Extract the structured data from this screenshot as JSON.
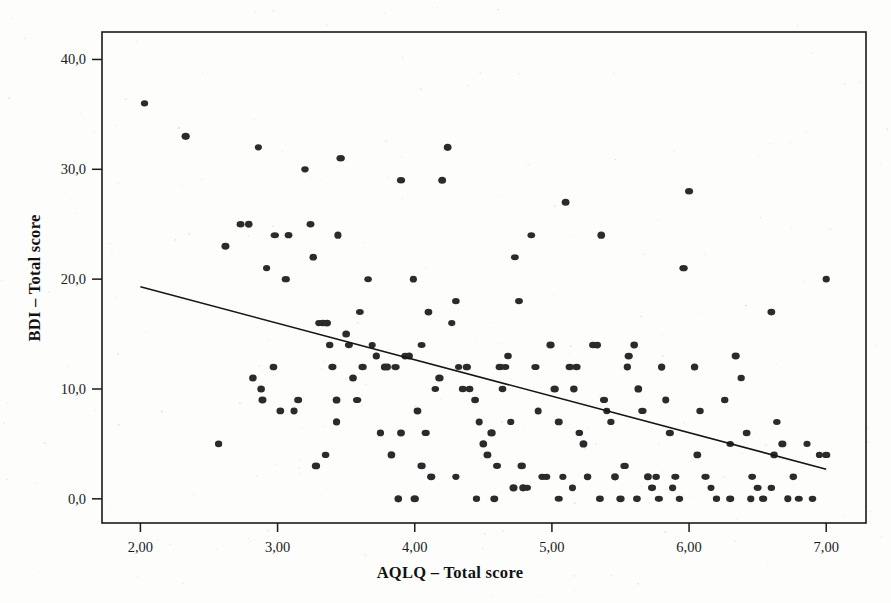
{
  "chart_data": {
    "type": "scatter",
    "title": "",
    "xlabel": "AQLQ – Total score",
    "ylabel": "BDI – Total score",
    "xlim": [
      1.72,
      7.29
    ],
    "ylim": [
      -2.2,
      42.5
    ],
    "xticks": [
      2,
      3,
      4,
      5,
      6,
      7
    ],
    "xtick_labels": [
      "2,00",
      "3,00",
      "4,00",
      "5,00",
      "6,00",
      "7,00"
    ],
    "yticks": [
      0,
      10,
      20,
      30,
      40
    ],
    "ytick_labels": [
      "0,0",
      "10,0",
      "20,0",
      "30,0",
      "40,0"
    ],
    "grid": false,
    "legend": "none",
    "marker": "filled-circle",
    "marker_color": "#2b2b2b",
    "frame_color": "#1a1a1a",
    "fit_line": {
      "label": "linear regression",
      "x": [
        2.0,
        7.0
      ],
      "y": [
        19.3,
        2.7
      ],
      "slope": -3.32,
      "intercept": 25.94,
      "color": "#151515"
    },
    "points": [
      [
        2.03,
        36.0
      ],
      [
        2.33,
        33.0
      ],
      [
        2.62,
        23.0
      ],
      [
        2.57,
        5.0
      ],
      [
        2.73,
        25.0
      ],
      [
        2.79,
        25.0
      ],
      [
        2.82,
        11.0
      ],
      [
        2.86,
        32.0
      ],
      [
        2.88,
        10.0
      ],
      [
        2.89,
        9.0
      ],
      [
        2.92,
        21.0
      ],
      [
        2.97,
        12.0
      ],
      [
        3.02,
        8.0
      ],
      [
        3.06,
        20.0
      ],
      [
        3.12,
        8.0
      ],
      [
        3.15,
        9.0
      ],
      [
        3.2,
        30.0
      ],
      [
        3.24,
        25.0
      ],
      [
        3.26,
        22.0
      ],
      [
        3.28,
        3.0
      ],
      [
        3.3,
        16.0
      ],
      [
        3.33,
        16.0
      ],
      [
        3.36,
        16.0
      ],
      [
        3.38,
        14.0
      ],
      [
        3.4,
        12.0
      ],
      [
        3.43,
        9.0
      ],
      [
        3.46,
        31.0
      ],
      [
        3.5,
        15.0
      ],
      [
        3.52,
        14.0
      ],
      [
        3.55,
        11.0
      ],
      [
        3.58,
        9.0
      ],
      [
        3.62,
        12.0
      ],
      [
        3.66,
        20.0
      ],
      [
        3.69,
        14.0
      ],
      [
        3.72,
        13.0
      ],
      [
        3.75,
        6.0
      ],
      [
        3.78,
        12.0
      ],
      [
        3.8,
        12.0
      ],
      [
        3.83,
        4.0
      ],
      [
        3.86,
        12.0
      ],
      [
        3.9,
        29.0
      ],
      [
        3.93,
        13.0
      ],
      [
        3.96,
        13.0
      ],
      [
        3.99,
        20.0
      ],
      [
        4.02,
        8.0
      ],
      [
        4.05,
        14.0
      ],
      [
        4.08,
        6.0
      ],
      [
        4.12,
        2.0
      ],
      [
        4.15,
        10.0
      ],
      [
        4.18,
        11.0
      ],
      [
        4.2,
        29.0
      ],
      [
        4.24,
        32.0
      ],
      [
        4.27,
        16.0
      ],
      [
        4.3,
        18.0
      ],
      [
        4.32,
        12.0
      ],
      [
        4.35,
        10.0
      ],
      [
        4.38,
        12.0
      ],
      [
        4.4,
        10.0
      ],
      [
        4.44,
        9.0
      ],
      [
        4.47,
        7.0
      ],
      [
        4.5,
        5.0
      ],
      [
        4.53,
        4.0
      ],
      [
        4.56,
        6.0
      ],
      [
        4.6,
        3.0
      ],
      [
        4.64,
        10.0
      ],
      [
        4.68,
        13.0
      ],
      [
        4.7,
        7.0
      ],
      [
        4.73,
        22.0
      ],
      [
        4.76,
        18.0
      ],
      [
        4.79,
        1.0
      ],
      [
        4.82,
        1.0
      ],
      [
        4.85,
        24.0
      ],
      [
        4.88,
        12.0
      ],
      [
        4.9,
        8.0
      ],
      [
        4.93,
        2.0
      ],
      [
        4.96,
        2.0
      ],
      [
        4.99,
        14.0
      ],
      [
        5.02,
        10.0
      ],
      [
        5.05,
        7.0
      ],
      [
        5.08,
        2.0
      ],
      [
        5.1,
        27.0
      ],
      [
        5.13,
        12.0
      ],
      [
        5.16,
        10.0
      ],
      [
        5.2,
        6.0
      ],
      [
        5.23,
        5.0
      ],
      [
        5.26,
        2.0
      ],
      [
        5.3,
        14.0
      ],
      [
        5.33,
        14.0
      ],
      [
        5.36,
        24.0
      ],
      [
        5.38,
        9.0
      ],
      [
        5.4,
        8.0
      ],
      [
        5.43,
        7.0
      ],
      [
        5.46,
        2.0
      ],
      [
        5.5,
        0.0
      ],
      [
        5.53,
        3.0
      ],
      [
        5.56,
        13.0
      ],
      [
        5.6,
        14.0
      ],
      [
        5.63,
        10.0
      ],
      [
        5.66,
        8.0
      ],
      [
        5.7,
        2.0
      ],
      [
        5.73,
        1.0
      ],
      [
        5.76,
        2.0
      ],
      [
        5.8,
        12.0
      ],
      [
        5.83,
        9.0
      ],
      [
        5.86,
        6.0
      ],
      [
        5.9,
        2.0
      ],
      [
        5.93,
        0.0
      ],
      [
        5.96,
        21.0
      ],
      [
        6.0,
        28.0
      ],
      [
        6.04,
        12.0
      ],
      [
        6.08,
        8.0
      ],
      [
        6.12,
        2.0
      ],
      [
        6.16,
        1.0
      ],
      [
        6.2,
        0.0
      ],
      [
        6.26,
        9.0
      ],
      [
        6.3,
        5.0
      ],
      [
        6.34,
        13.0
      ],
      [
        6.38,
        11.0
      ],
      [
        6.42,
        6.0
      ],
      [
        6.46,
        2.0
      ],
      [
        6.5,
        1.0
      ],
      [
        6.54,
        0.0
      ],
      [
        6.6,
        17.0
      ],
      [
        6.64,
        7.0
      ],
      [
        6.68,
        5.0
      ],
      [
        6.72,
        0.0
      ],
      [
        6.76,
        2.0
      ],
      [
        6.8,
        0.0
      ],
      [
        6.86,
        5.0
      ],
      [
        6.9,
        0.0
      ],
      [
        6.95,
        4.0
      ],
      [
        7.0,
        20.0
      ],
      [
        7.0,
        4.0
      ],
      [
        2.98,
        24.0
      ],
      [
        3.08,
        24.0
      ],
      [
        3.44,
        24.0
      ],
      [
        3.6,
        17.0
      ],
      [
        4.1,
        17.0
      ],
      [
        4.62,
        12.0
      ],
      [
        4.66,
        12.0
      ],
      [
        5.18,
        12.0
      ],
      [
        5.55,
        12.0
      ],
      [
        6.06,
        4.0
      ],
      [
        6.62,
        4.0
      ],
      [
        4.45,
        0.0
      ],
      [
        4.58,
        0.0
      ],
      [
        5.05,
        0.0
      ],
      [
        5.35,
        0.0
      ],
      [
        5.62,
        0.0
      ],
      [
        5.78,
        0.0
      ],
      [
        6.3,
        0.0
      ],
      [
        6.45,
        0.0
      ],
      [
        3.88,
        0.0
      ],
      [
        4.0,
        0.0
      ],
      [
        4.72,
        1.0
      ],
      [
        5.15,
        1.0
      ],
      [
        5.88,
        1.0
      ],
      [
        6.6,
        1.0
      ],
      [
        4.3,
        2.0
      ],
      [
        4.78,
        3.0
      ],
      [
        3.35,
        4.0
      ],
      [
        3.43,
        7.0
      ],
      [
        3.9,
        6.0
      ],
      [
        4.05,
        3.0
      ]
    ]
  },
  "axis": {
    "x_title": "AQLQ – Total score",
    "y_title": "BDI – Total score"
  }
}
